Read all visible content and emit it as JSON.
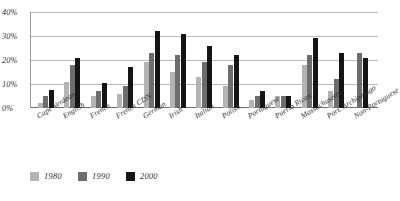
{
  "chart_data": {
    "type": "bar",
    "title": "",
    "subtitle": "",
    "xlabel": "",
    "ylabel": "",
    "ylim": [
      0,
      40
    ],
    "y_ticks": [
      "0%",
      "10%",
      "20%",
      "30%",
      "40%"
    ],
    "y_tick_values": [
      0,
      10,
      20,
      30,
      40
    ],
    "grid": true,
    "legend_position": "bottom-left",
    "categories": [
      "Cape Verdean",
      "English",
      "French",
      "French CDN",
      "German",
      "Irish",
      "Italian",
      "Polish",
      "Portuguese",
      "Puerto Rican",
      "Massachusetts",
      "Port. Archipelago",
      "Non-Portuguese"
    ],
    "series": [
      {
        "name": "1980",
        "color": "#b4b4b4",
        "values": [
          2,
          11,
          5,
          6,
          19,
          15,
          13,
          9,
          3.5,
          5,
          18,
          7,
          null
        ]
      },
      {
        "name": "1990",
        "color": "#6d6d6d",
        "values": [
          5,
          18,
          7,
          9,
          23,
          22,
          19,
          18,
          5,
          5,
          22,
          12,
          23
        ]
      },
      {
        "name": "2000",
        "color": "#151515",
        "values": [
          7.5,
          21,
          10.5,
          17,
          32,
          31,
          26,
          22,
          7,
          5,
          29,
          23,
          21
        ]
      }
    ]
  },
  "legend": {
    "items": [
      {
        "label": "1980",
        "color": "#b4b4b4"
      },
      {
        "label": "1990",
        "color": "#6d6d6d"
      },
      {
        "label": "2000",
        "color": "#151515"
      }
    ]
  }
}
